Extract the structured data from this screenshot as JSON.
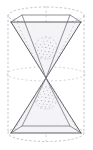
{
  "figure": {
    "style": "technical pen-and-ink line drawing, grayscale, stippled shading",
    "canvas": {
      "width": 93,
      "height": 150,
      "background": "#ffffff"
    },
    "colors": {
      "visible_edge": "#4a4a52",
      "hidden_edge": "#9a9aa4",
      "axis": "#b4b4be",
      "stipple": "#7b7b86",
      "background": "#ffffff"
    },
    "parts": [
      {
        "id": "cylinder-top-ellipse",
        "label": "Cylinder top rim (dashed ellipse)",
        "style": "dashed"
      },
      {
        "id": "cylinder-bottom-ellipse",
        "label": "Cylinder bottom rim (dashed ellipse)",
        "style": "dashed"
      },
      {
        "id": "cylinder-mid-ellipse",
        "label": "Cylinder mid-height section (dashed ellipse)",
        "style": "dashed"
      },
      {
        "id": "cylinder-left-wall",
        "label": "Cylinder left generatrix (dashed)",
        "style": "dashed"
      },
      {
        "id": "cylinder-right-wall",
        "label": "Cylinder right generatrix (dashed)",
        "style": "dashed"
      },
      {
        "id": "upper-pyramid",
        "label": "Upper pyramid, square base at top, apex at centre",
        "style": "solid"
      },
      {
        "id": "lower-pyramid",
        "label": "Lower pyramid, square base at bottom, apex at centre",
        "style": "solid"
      },
      {
        "id": "upper-sphere",
        "label": "Stippled sphere inside upper cone",
        "style": "stipple"
      },
      {
        "id": "lower-sphere",
        "label": "Stippled sphere inside lower cone",
        "style": "stipple"
      },
      {
        "id": "central-axis",
        "label": "Vertical centre axis (dashed)",
        "style": "dashed"
      }
    ],
    "geometry": {
      "top_face": {
        "left_x": 11,
        "right_x": 81,
        "front_y": 22,
        "back_y": 15
      },
      "bottom_face": {
        "left_x": 11,
        "right_x": 81,
        "front_y": 133,
        "back_y": 126
      },
      "apex": {
        "x": 46,
        "y": 78
      },
      "mid_ellipse": {
        "cx": 46,
        "cy": 74,
        "rx": 39,
        "ry": 7
      },
      "upper_sphere": {
        "cx": 46,
        "cy": 48,
        "r": 11
      },
      "lower_sphere": {
        "cx": 46,
        "cy": 98,
        "r": 11
      }
    }
  }
}
